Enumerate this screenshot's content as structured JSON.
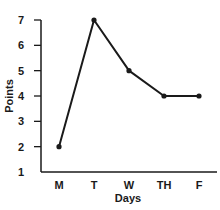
{
  "chart_data": {
    "type": "line",
    "title": "",
    "xlabel": "Days",
    "ylabel": "Points",
    "categories": [
      "M",
      "T",
      "W",
      "TH",
      "F"
    ],
    "values": [
      2,
      7,
      5,
      4,
      4
    ],
    "yticks": [
      1,
      2,
      3,
      4,
      5,
      6,
      7
    ],
    "ylim": [
      1,
      7
    ],
    "grid": false,
    "legend": "none",
    "markers": true,
    "line_color": "#1a1a1a"
  }
}
